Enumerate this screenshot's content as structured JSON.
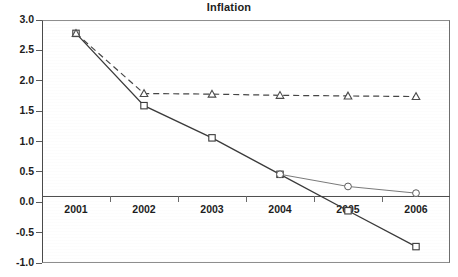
{
  "chart_data": {
    "type": "line",
    "title": "Inflation",
    "xlabel": "",
    "ylabel": "",
    "categories": [
      "2001",
      "2002",
      "2003",
      "2004",
      "2005",
      "2006"
    ],
    "ylim": [
      -1.0,
      3.0
    ],
    "ytick_labels": [
      "3.0",
      "2.5",
      "2.0",
      "1.5",
      "1.0",
      "0.5",
      "0.0",
      "-0.5",
      "-1.0"
    ],
    "ytick_values": [
      3.0,
      2.5,
      2.0,
      1.5,
      1.0,
      0.5,
      0.0,
      -0.5,
      -1.0
    ],
    "grid": false,
    "legend": "none",
    "series": [
      {
        "name": "square-series",
        "marker": "square",
        "linestyle": "solid",
        "x": [
          "2001",
          "2002",
          "2003",
          "2004",
          "2005",
          "2006"
        ],
        "values": [
          2.78,
          1.59,
          1.06,
          0.46,
          -0.14,
          -0.73
        ]
      },
      {
        "name": "triangle-series",
        "marker": "triangle",
        "linestyle": "dashed",
        "x": [
          "2001",
          "2002",
          "2003",
          "2004",
          "2005",
          "2006"
        ],
        "values": [
          2.78,
          1.79,
          1.78,
          1.76,
          1.75,
          1.74
        ]
      },
      {
        "name": "circle-series",
        "marker": "circle",
        "linestyle": "solid-thin",
        "x": [
          "2004",
          "2005",
          "2006"
        ],
        "values": [
          0.46,
          0.26,
          0.15
        ]
      }
    ]
  },
  "axes": {
    "x_labels": [
      "2001",
      "2002",
      "2003",
      "2004",
      "2005",
      "2006"
    ],
    "y_labels": [
      "3.0",
      "2.5",
      "2.0",
      "1.5",
      "1.0",
      "0.5",
      "0.0",
      "-0.5",
      "-1.0"
    ]
  }
}
